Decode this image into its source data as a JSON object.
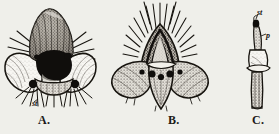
{
  "plate": {
    "title": "Comparative plate of insect terminal structures",
    "background_color": "#efefea",
    "ink_color": "#1a1715",
    "width": 279,
    "height": 134
  },
  "figures": [
    {
      "id": "A",
      "caption": "A.",
      "description": "Ventral view of terminal abdominal segment with two broad lateral lobes, a large black median cavity and a pale transverse band below, fringed with radiating bristles",
      "labels": [
        {
          "text": "st",
          "name": "stigma-label",
          "meaning": "st"
        }
      ]
    },
    {
      "id": "B",
      "caption": "B.",
      "description": "Dorsal view of terminal segment crowned with a dense fan of long radiating spines, flanked by two wing-like lobes bearing dark round spots, tapering to a pointed median lobe",
      "labels": []
    },
    {
      "id": "C",
      "caption": "C.",
      "description": "Lateral detail of a single narrow stalked appendage with an expanded collar near its middle",
      "labels": [
        {
          "text": "st",
          "name": "stigma-label",
          "meaning": "st"
        },
        {
          "text": "p",
          "name": "process-label",
          "meaning": "p"
        }
      ]
    }
  ],
  "captions": {
    "a": "A.",
    "b": "B.",
    "c": "C."
  },
  "annotations": {
    "a_st": "st",
    "c_st": "st",
    "c_p": "p"
  }
}
